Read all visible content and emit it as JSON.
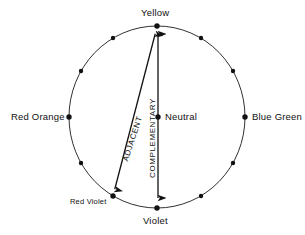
{
  "diagram": {
    "geometry": {
      "center_x": 157,
      "center_y": 117,
      "radius_x": 88,
      "radius_y": 91,
      "hue_point_count": 12,
      "stroke_color": "#1a1a1a",
      "dot_color": "#111111",
      "background": "#ffffff"
    },
    "labels": {
      "yellow": "Yellow",
      "blue_green": "Blue Green",
      "violet": "Violet",
      "red_orange": "Red Orange",
      "neutral": "Neutral",
      "red_violet": "Red Violet",
      "adjacent": "ADJACENT",
      "complementary": "COMPLEMENTARY"
    },
    "arrows": [
      {
        "name": "adjacent-arrow",
        "label": "ADJACENT",
        "from": "Yellow",
        "to": "Red Violet",
        "from_x": 157,
        "from_y": 27,
        "to_x": 113,
        "to_y": 196,
        "double_headed": true
      },
      {
        "name": "complementary-arrow",
        "label": "COMPLEMENTARY",
        "from": "Yellow",
        "to": "Violet",
        "from_x": 158,
        "from_y": 27,
        "to_x": 158,
        "to_y": 205,
        "double_headed": true
      }
    ],
    "hue_points": [
      {
        "angle_deg": 90,
        "x": 157,
        "y": 26,
        "label": "Yellow"
      },
      {
        "angle_deg": 60,
        "x": 201,
        "y": 38,
        "label": ""
      },
      {
        "angle_deg": 30,
        "x": 233,
        "y": 71,
        "label": ""
      },
      {
        "angle_deg": 0,
        "x": 245,
        "y": 117,
        "label": "Blue Green"
      },
      {
        "angle_deg": -30,
        "x": 233,
        "y": 163,
        "label": ""
      },
      {
        "angle_deg": -60,
        "x": 201,
        "y": 196,
        "label": ""
      },
      {
        "angle_deg": -90,
        "x": 157,
        "y": 208,
        "label": "Violet"
      },
      {
        "angle_deg": -120,
        "x": 113,
        "y": 196,
        "label": "Red Violet"
      },
      {
        "angle_deg": -150,
        "x": 81,
        "y": 163,
        "label": ""
      },
      {
        "angle_deg": 180,
        "x": 69,
        "y": 117,
        "label": "Red Orange"
      },
      {
        "angle_deg": 150,
        "x": 81,
        "y": 71,
        "label": ""
      },
      {
        "angle_deg": 120,
        "x": 113,
        "y": 38,
        "label": ""
      }
    ],
    "center_point": {
      "x": 158,
      "y": 117,
      "label": "Neutral"
    }
  }
}
